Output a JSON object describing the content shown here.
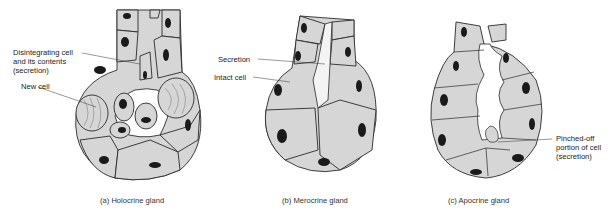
{
  "figure": {
    "colors": {
      "cell_fill": "#d6d6d6",
      "outline": "#2a2a2a",
      "nucleus": "#1a1a1a",
      "background": "#ffffff"
    },
    "panels": [
      {
        "id": "a",
        "caption": "(a)  Holocrine gland",
        "labels": [
          {
            "text_lines": [
              "Disintegrating cell",
              "and its contents",
              "(secretion)"
            ]
          },
          {
            "text_lines": [
              "New cell"
            ]
          }
        ]
      },
      {
        "id": "b",
        "caption": "(b)  Merocrine gland",
        "labels": [
          {
            "text_lines": [
              "Secretion"
            ]
          },
          {
            "text_lines": [
              "Intact cell"
            ]
          }
        ]
      },
      {
        "id": "c",
        "caption": "(c)  Apocrine gland",
        "labels": [
          {
            "text_lines": [
              "Pinched-off",
              "portion of cell",
              "(secretion)"
            ]
          }
        ]
      }
    ]
  }
}
